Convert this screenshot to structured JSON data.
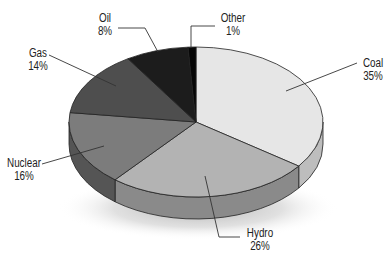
{
  "chart_data": {
    "type": "pie",
    "title": "",
    "style": "3d-pie",
    "categories": [
      "Coal",
      "Hydro",
      "Nuclear",
      "Gas",
      "Oil",
      "Other"
    ],
    "values": [
      35,
      26,
      16,
      14,
      8,
      1
    ],
    "unit": "%",
    "slices": [
      {
        "name": "Coal",
        "value": 35,
        "label": "35%",
        "color": "#e6e6e6",
        "side": "#bdbdbd"
      },
      {
        "name": "Hydro",
        "value": 26,
        "label": "26%",
        "color": "#b3b3b3",
        "side": "#8a8a8a"
      },
      {
        "name": "Nuclear",
        "value": 16,
        "label": "16%",
        "color": "#7c7c7c",
        "side": "#555555"
      },
      {
        "name": "Gas",
        "value": 14,
        "label": "14%",
        "color": "#4e4e4e",
        "side": "#333333"
      },
      {
        "name": "Oil",
        "value": 8,
        "label": "8%",
        "color": "#1c1c1c",
        "side": "#0e0e0e"
      },
      {
        "name": "Other",
        "value": 1,
        "label": "1%",
        "color": "#060606",
        "side": "#000000"
      }
    ],
    "legend": "none (leader-line labels)"
  },
  "labels": {
    "coal": {
      "name": "Coal",
      "pct": "35%"
    },
    "hydro": {
      "name": "Hydro",
      "pct": "26%"
    },
    "nuclear": {
      "name": "Nuclear",
      "pct": "16%"
    },
    "gas": {
      "name": "Gas",
      "pct": "14%"
    },
    "oil": {
      "name": "Oil",
      "pct": "8%"
    },
    "other": {
      "name": "Other",
      "pct": "1%"
    }
  }
}
